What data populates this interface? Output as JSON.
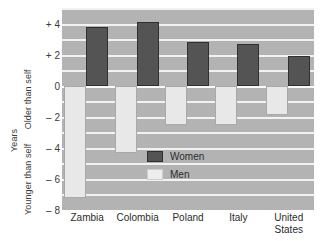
{
  "chart_data": {
    "type": "bar",
    "title": "",
    "subtitle": "",
    "xlabel": "",
    "ylabel": "Years",
    "ylabel_upper": "Older than self",
    "ylabel_lower": "Younger than self",
    "categories": [
      "Zambia",
      "Colombia",
      "Poland",
      "Italy",
      "United States"
    ],
    "series": [
      {
        "name": "Women",
        "color": "#545454",
        "values": [
          3.8,
          4.1,
          2.8,
          2.7,
          1.9
        ]
      },
      {
        "name": "Men",
        "color": "#e8e8e8",
        "values": [
          -7.2,
          -4.3,
          -2.5,
          -2.5,
          -1.9
        ]
      }
    ],
    "ylim": [
      -8,
      5
    ],
    "yticks": [
      4,
      2,
      0,
      -2,
      -4,
      -6,
      -8
    ],
    "ytick_labels": [
      "+ 4",
      "+ 2",
      "0",
      "– 2",
      "– 4",
      "– 6",
      "– 8"
    ],
    "grid": true,
    "grid_axis": "y",
    "legend_position": "inside-lower-right",
    "plot_background": "#b3b3b3",
    "gridline_color": "#f2f2f2"
  },
  "legend": {
    "entries": [
      {
        "label": "Women",
        "swatch": "women-swatch"
      },
      {
        "label": "Men",
        "swatch": "men-swatch"
      }
    ]
  },
  "caption": ""
}
